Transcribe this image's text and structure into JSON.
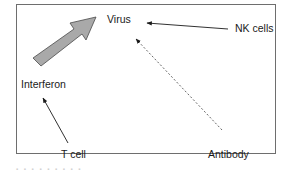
{
  "diagram": {
    "nodes": [
      {
        "id": "virus",
        "label": "Virus"
      },
      {
        "id": "nk_cells",
        "label": "NK cells"
      },
      {
        "id": "interferon",
        "label": "Interferon"
      },
      {
        "id": "t_cell",
        "label": "T cell"
      },
      {
        "id": "antibody",
        "label": "Antibody"
      }
    ],
    "edges": [
      {
        "from": "interferon",
        "to": "virus",
        "style": "thick-block-arrow",
        "color": "#a9a9a9"
      },
      {
        "from": "nk_cells",
        "to": "virus",
        "style": "solid-arrow"
      },
      {
        "from": "antibody",
        "to": "virus",
        "style": "dashed-arrow"
      },
      {
        "from": "t_cell",
        "to": "interferon",
        "style": "solid-arrow"
      }
    ]
  },
  "caption": "▪ ▪ ▪ ▪ ▪ ▪ ▪ ▪ ▪"
}
